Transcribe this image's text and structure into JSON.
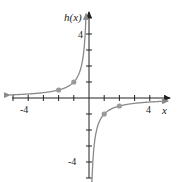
{
  "chart_data": {
    "type": "line",
    "title": "",
    "function": "h(x) = -1/x",
    "xlabel": "x",
    "ylabel": "h(x)",
    "xlim": [
      -5.5,
      5.5
    ],
    "ylim": [
      -5,
      5
    ],
    "x_tick_labels": [
      "-4",
      "4"
    ],
    "y_tick_labels": [
      "4",
      "-4"
    ],
    "grid": false,
    "series": [
      {
        "name": "left branch",
        "points": [
          [
            -5,
            0.2
          ],
          [
            -2,
            0.5
          ],
          [
            -1,
            1
          ],
          [
            -0.25,
            4
          ]
        ]
      },
      {
        "name": "right branch",
        "points": [
          [
            0.25,
            -4
          ],
          [
            1,
            -1
          ],
          [
            2,
            -0.5
          ],
          [
            5,
            -0.2
          ]
        ]
      }
    ],
    "marked_points": [
      [
        -2,
        0.5
      ],
      [
        -1,
        1
      ],
      [
        1,
        -1
      ],
      [
        2,
        -0.5
      ]
    ],
    "colors": {
      "curve": "#8a8a8a",
      "points": "#9a9a9a",
      "axes": "#222222"
    }
  }
}
